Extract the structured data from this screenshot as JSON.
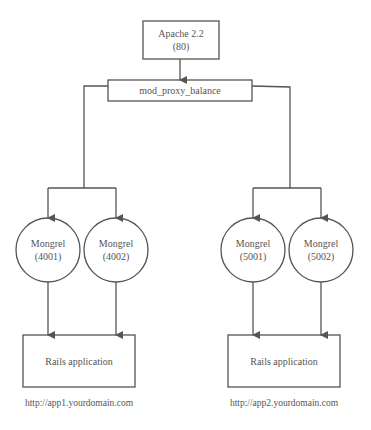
{
  "diagram": {
    "apache": {
      "title": "Apache 2.2",
      "port": "(80)"
    },
    "balancer": {
      "label": "mod_proxy_balance"
    },
    "mongrels": [
      {
        "name": "Mongrel",
        "port": "(4001)"
      },
      {
        "name": "Mongrel",
        "port": "(4002)"
      },
      {
        "name": "Mongrel",
        "port": "(5001)"
      },
      {
        "name": "Mongrel",
        "port": "(5002)"
      }
    ],
    "apps": [
      {
        "label": "Rails application",
        "url": "http://app1.yourdomain.com"
      },
      {
        "label": "Rails application",
        "url": "http://app2.yourdomain.com"
      }
    ],
    "colors": {
      "stroke": "#555555",
      "text": "#555555",
      "background": "#ffffff"
    }
  }
}
